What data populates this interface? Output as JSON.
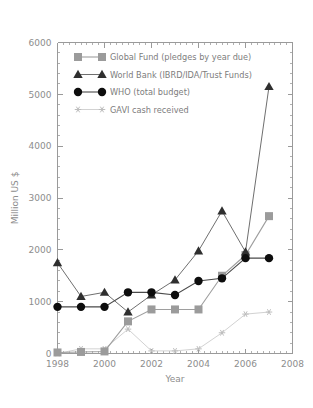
{
  "chart_data": {
    "type": "line",
    "title": "",
    "xlabel": "Year",
    "ylabel": "Million US $",
    "xlim": [
      1998,
      2008
    ],
    "ylim": [
      0,
      6000
    ],
    "grid": false,
    "legend_position": "top-left",
    "x_ticks": [
      1998,
      2000,
      2002,
      2004,
      2006,
      2008
    ],
    "x_tick_labels": [
      "1998",
      "2000",
      "2002",
      "2004",
      "2006",
      "2008"
    ],
    "x_minor_ticks": [
      1999,
      2001,
      2003,
      2005,
      2007
    ],
    "y_ticks": [
      0,
      1000,
      2000,
      3000,
      4000,
      5000,
      6000
    ],
    "y_tick_labels": [
      "0",
      "1000",
      "2000",
      "3000",
      "4000",
      "5000",
      "6000"
    ],
    "x": [
      1998,
      1999,
      2000,
      2001,
      2002,
      2003,
      2004,
      2005,
      2006,
      2007
    ],
    "series": [
      {
        "name": "Global Fund (pledges by year due)",
        "marker": "square",
        "color": "#9b9b9b",
        "values": [
          20,
          30,
          40,
          620,
          850,
          850,
          850,
          1500,
          1900,
          2650
        ]
      },
      {
        "name": "World Bank (IBRD/IDA/Trust Funds)",
        "marker": "triangle",
        "color": "#2f2f2f",
        "values": [
          1750,
          1100,
          1180,
          800,
          1130,
          1420,
          1980,
          2750,
          1960,
          5150
        ]
      },
      {
        "name": "WHO (total budget)",
        "marker": "circle",
        "color": "#0d0d0d",
        "values": [
          900,
          900,
          900,
          1180,
          1180,
          1130,
          1400,
          1450,
          1840,
          1840
        ]
      },
      {
        "name": "GAVI cash received",
        "marker": "asterisk",
        "color": "#bdbdbd",
        "values": [
          0,
          90,
          90,
          470,
          50,
          50,
          90,
          400,
          760,
          800
        ]
      }
    ]
  },
  "legend": {
    "items": [
      {
        "label": "Global Fund (pledges by year due)",
        "marker": "square-marker"
      },
      {
        "label": "World Bank (IBRD/IDA/Trust Funds)",
        "marker": "triangle-marker"
      },
      {
        "label": "WHO (total budget)",
        "marker": "circle-marker"
      },
      {
        "label": "GAVI cash received",
        "marker": "asterisk-marker"
      }
    ]
  },
  "axes": {
    "x_title": "Year",
    "y_title": "Million US $"
  }
}
